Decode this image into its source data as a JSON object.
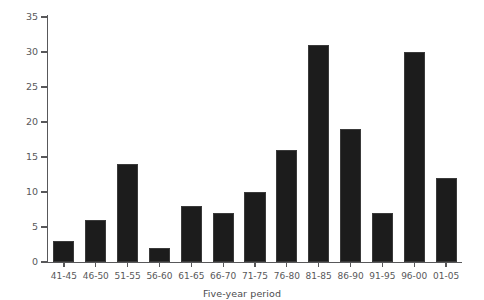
{
  "chart_data": {
    "type": "bar",
    "title": "",
    "subtitle": "",
    "xlabel": "Five-year period",
    "ylabel": "Number of birds",
    "categories": [
      "41-45",
      "46-50",
      "51-55",
      "56-60",
      "61-65",
      "66-70",
      "71-75",
      "76-80",
      "81-85",
      "86-90",
      "91-95",
      "96-00",
      "01-05"
    ],
    "values": [
      3,
      6,
      14,
      2,
      8,
      7,
      10,
      16,
      31,
      19,
      7,
      30,
      12
    ],
    "ylim": [
      0,
      35
    ],
    "y_ticks": [
      0,
      5,
      10,
      15,
      20,
      25,
      30,
      35
    ],
    "y_tick_labels": [
      "0",
      "5",
      "10",
      "15",
      "20",
      "25",
      "30",
      "35"
    ],
    "grid": false,
    "legend": false,
    "legend_position": "none",
    "bar_color": "#1c1c1c",
    "axis_color": "#58585a",
    "text_color": "#58585a",
    "background_color": "#ffffff",
    "annotations": []
  }
}
